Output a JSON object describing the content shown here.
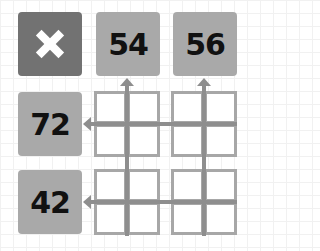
{
  "puzzle": {
    "corner_icon": "close-icon",
    "column_clues": [
      "54",
      "56"
    ],
    "row_clues": [
      "72",
      "42"
    ],
    "grid": {
      "blocks_rows": 2,
      "blocks_cols": 2,
      "cells_per_block": 4,
      "cell_values": [
        [
          "",
          "",
          "",
          ""
        ],
        [
          "",
          "",
          "",
          ""
        ],
        [
          "",
          "",
          "",
          ""
        ],
        [
          "",
          "",
          "",
          ""
        ]
      ]
    },
    "colors": {
      "clue_tile": "#a9a9a9",
      "corner_tile": "#727272",
      "cell_border": "#a7a7a7",
      "arrow": "#8e8e8e",
      "clue_text": "#111111"
    }
  }
}
